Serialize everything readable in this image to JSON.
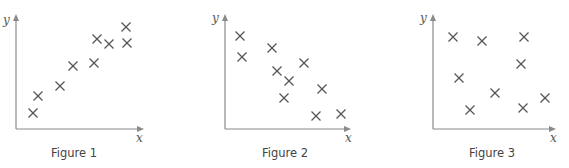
{
  "chart_data": [
    {
      "type": "scatter",
      "title": "Figure 1",
      "xlabel": "x",
      "ylabel": "y",
      "grid": false,
      "marker": "x",
      "trend": "positive correlation",
      "x": [
        17,
        22,
        44,
        57,
        78,
        81,
        93,
        110,
        111
      ],
      "y": [
        16,
        33,
        43,
        63,
        66,
        90,
        85,
        102,
        86
      ],
      "pixel_points": [
        [
          33,
          113
        ],
        [
          38,
          96
        ],
        [
          60,
          86
        ],
        [
          73,
          66
        ],
        [
          94,
          63
        ],
        [
          97,
          39
        ],
        [
          109,
          44
        ],
        [
          126,
          27
        ],
        [
          127,
          43
        ]
      ]
    },
    {
      "type": "scatter",
      "title": "Figure 2",
      "xlabel": "x",
      "ylabel": "y",
      "grid": false,
      "marker": "x",
      "trend": "negative correlation",
      "x": [
        15,
        17,
        47,
        52,
        64,
        79,
        59,
        97,
        91,
        116
      ],
      "y": [
        93,
        72,
        81,
        58,
        48,
        66,
        31,
        40,
        13,
        15
      ],
      "pixel_points": [
        [
          240,
          36
        ],
        [
          242,
          57
        ],
        [
          272,
          48
        ],
        [
          277,
          71
        ],
        [
          289,
          81
        ],
        [
          304,
          63
        ],
        [
          284,
          98
        ],
        [
          322,
          89
        ],
        [
          316,
          116
        ],
        [
          341,
          114
        ]
      ]
    },
    {
      "type": "scatter",
      "title": "Figure 3",
      "xlabel": "x",
      "ylabel": "y",
      "grid": false,
      "marker": "x",
      "trend": "no correlation",
      "x": [
        20,
        49,
        91,
        88,
        26,
        62,
        37,
        90,
        112
      ],
      "y": [
        92,
        88,
        92,
        65,
        51,
        36,
        19,
        21,
        31
      ],
      "pixel_points": [
        [
          453,
          37
        ],
        [
          482,
          41
        ],
        [
          524,
          37
        ],
        [
          521,
          64
        ],
        [
          459,
          78
        ],
        [
          495,
          93
        ],
        [
          470,
          110
        ],
        [
          523,
          108
        ],
        [
          545,
          98
        ]
      ]
    }
  ],
  "figures": [
    {
      "caption": "Figure 1",
      "xlabel": "x",
      "ylabel": "y"
    },
    {
      "caption": "Figure 2",
      "xlabel": "x",
      "ylabel": "y"
    },
    {
      "caption": "Figure 3",
      "xlabel": "x",
      "ylabel": "y"
    }
  ]
}
